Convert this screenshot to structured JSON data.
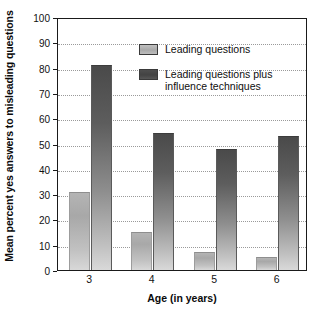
{
  "chart_data": {
    "type": "bar",
    "title": "",
    "xlabel": "Age (in years)",
    "ylabel": "Mean percent yes answers to misleading questions",
    "categories": [
      "3",
      "4",
      "5",
      "6"
    ],
    "ylim": [
      0,
      100
    ],
    "y_ticks": [
      0,
      10,
      20,
      30,
      40,
      50,
      60,
      70,
      80,
      90,
      100
    ],
    "grid": true,
    "legend_position": "upper center",
    "series": [
      {
        "name": "Leading questions",
        "color": "#a9a9a9",
        "values": [
          31,
          15,
          7,
          5
        ]
      },
      {
        "name": "Leading questions plus\ninfluence techniques",
        "color": "#4a4a4a",
        "values": [
          81,
          54,
          48,
          53
        ]
      }
    ]
  },
  "axes": {
    "y_title": "Mean percent yes answers to misleading questions",
    "x_title": "Age (in years)",
    "y_tick_labels": [
      "0",
      "10",
      "20",
      "30",
      "40",
      "50",
      "60",
      "70",
      "80",
      "90",
      "100"
    ],
    "x_tick_labels": [
      "3",
      "4",
      "5",
      "6"
    ]
  },
  "legend": {
    "items": [
      {
        "label": "Leading questions"
      },
      {
        "label": "Leading questions plus\ninfluence techniques"
      }
    ]
  }
}
